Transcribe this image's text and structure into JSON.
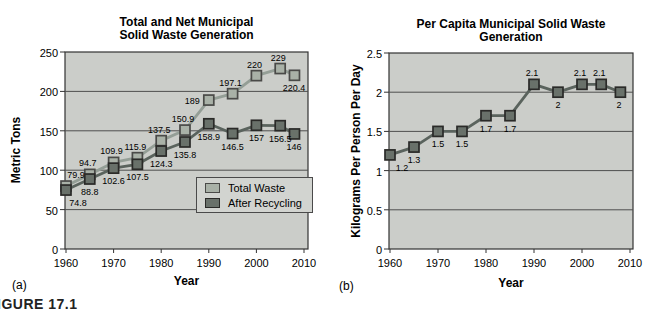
{
  "figure_caption": "FIGURE 17.1",
  "chart_data": [
    {
      "id": "a",
      "type": "line",
      "panel_label": "(a)",
      "title_lines": [
        "Total and Net Municipal",
        "Solid Waste Generation"
      ],
      "xlabel": "Year",
      "ylabel": "Metric Tons",
      "xlim": [
        1960,
        2010
      ],
      "ylim": [
        0,
        250
      ],
      "x_ticks": [
        1960,
        1970,
        1980,
        1990,
        2000,
        2010
      ],
      "y_ticks": [
        0,
        50,
        100,
        150,
        200,
        250
      ],
      "grid": "horizontal",
      "plot_bg": "#cbcdc9",
      "grid_color": "#4f4f4f",
      "border_color": "#333333",
      "legend_position": "inside-lower-right",
      "x": [
        1960,
        1965,
        1970,
        1975,
        1980,
        1985,
        1990,
        1995,
        2000,
        2005,
        2008
      ],
      "series": [
        {
          "name": "Total Waste",
          "values": [
            79.9,
            94.7,
            109.9,
            115.9,
            137.5,
            150.9,
            189,
            197.1,
            220,
            229,
            220.4
          ],
          "labels": [
            "79.9",
            "94.7",
            "109.9",
            "115.9",
            "137.5",
            "150.9",
            "189",
            "197.1",
            "220",
            "229",
            "220.4"
          ],
          "label_pos": [
            "above",
            "above",
            "above",
            "above",
            "above",
            "above",
            "left",
            "above",
            "above",
            "above",
            "below"
          ],
          "line_color": "#949e96",
          "marker_fill": "#a9b1a7",
          "marker_border": "#4a4a48"
        },
        {
          "name": "After Recycling",
          "values": [
            74.8,
            88.8,
            102.6,
            107.5,
            124.3,
            135.8,
            158.9,
            146.5,
            157,
            156.5,
            146
          ],
          "labels": [
            "74.8",
            "88.8",
            "102.6",
            "107.5",
            "124.3",
            "135.8",
            "158.9",
            "146.5",
            "157",
            "156.5",
            "146"
          ],
          "label_pos": [
            "below",
            "below",
            "below",
            "below",
            "below",
            "below",
            "below",
            "below",
            "below",
            "below",
            "below"
          ],
          "line_color": "#5a635d",
          "marker_fill": "#69716a",
          "marker_border": "#2a2a28"
        }
      ]
    },
    {
      "id": "b",
      "type": "line",
      "panel_label": "(b)",
      "title_lines": [
        "Per Capita Municipal Solid Waste Generation"
      ],
      "xlabel": "Year",
      "ylabel": "Kilograms Per Person Per Day",
      "xlim": [
        1960,
        2010
      ],
      "ylim": [
        0,
        2.5
      ],
      "x_ticks": [
        1960,
        1970,
        1980,
        1990,
        2000,
        2010
      ],
      "y_ticks": [
        0,
        0.5,
        1,
        1.5,
        2,
        2.5
      ],
      "grid": "horizontal",
      "plot_bg": "#cbcdc9",
      "grid_color": "#4f4f4f",
      "border_color": "#333333",
      "legend_position": "none",
      "x": [
        1960,
        1965,
        1970,
        1975,
        1980,
        1985,
        1990,
        1995,
        2000,
        2004,
        2008
      ],
      "series": [
        {
          "values": [
            1.2,
            1.3,
            1.5,
            1.5,
            1.7,
            1.7,
            2.1,
            2,
            2.1,
            2.1,
            2
          ],
          "labels": [
            "1.2",
            "1.3",
            "1.5",
            "1.5",
            "1.7",
            "1.7",
            "2.1",
            "2",
            "2.1",
            "2.1",
            "2"
          ],
          "label_pos": [
            "below",
            "below",
            "below",
            "below",
            "below",
            "below",
            "above",
            "below",
            "above",
            "above",
            "below"
          ],
          "line_color": "#5a635d",
          "marker_fill": "#69716a",
          "marker_border": "#2a2a28"
        }
      ]
    }
  ]
}
